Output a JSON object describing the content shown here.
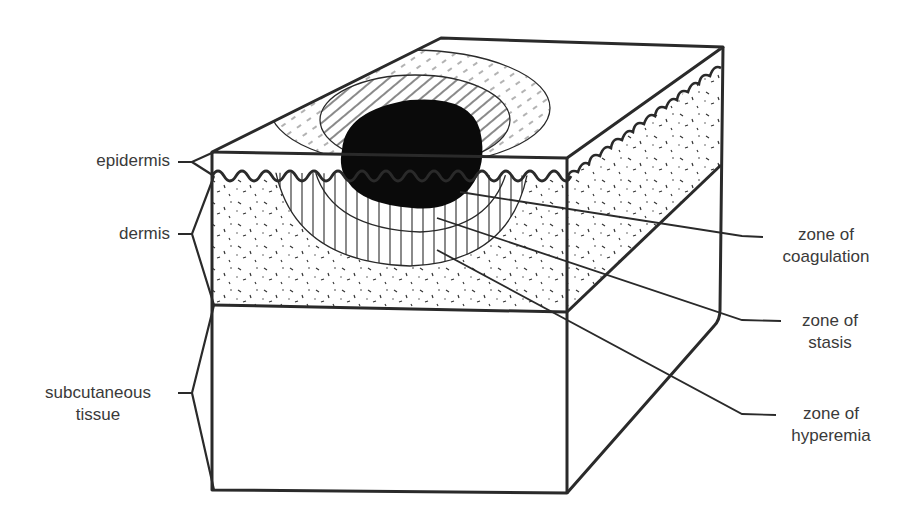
{
  "diagram": {
    "layers": [
      {
        "id": "epidermis",
        "label": "epidermis"
      },
      {
        "id": "dermis",
        "label": "dermis"
      },
      {
        "id": "subcutaneous",
        "label_line1": "subcutaneous",
        "label_line2": "tissue"
      }
    ],
    "zones": [
      {
        "id": "coagulation",
        "label_line1": "zone of",
        "label_line2": "coagulation"
      },
      {
        "id": "stasis",
        "label_line1": "zone of",
        "label_line2": "stasis"
      },
      {
        "id": "hyperemia",
        "label_line1": "zone of",
        "label_line2": "hyperemia"
      }
    ],
    "colors": {
      "line": "#2a2a2a",
      "text": "#3a3a3a",
      "coagulation_fill": "#0a0a0a",
      "background": "#ffffff"
    }
  }
}
